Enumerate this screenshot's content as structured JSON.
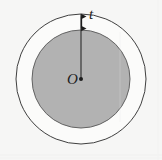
{
  "figure": {
    "background_color": "#f6f6f5",
    "labels": {
      "thickness_label": "t",
      "center_label": "O"
    },
    "geometry": {
      "center_x": 81,
      "center_y": 79,
      "outer_circle_radius": 65,
      "inner_circle_radius": 49,
      "annulus_thickness": 16,
      "outer_circle_fill": "#fbfbfa",
      "outer_circle_stroke": "#3a3a3a",
      "outer_circle_stroke_width": 1,
      "inner_circle_fill": "#b2b2b2",
      "inner_circle_stroke": "#5a5a5a",
      "inner_circle_stroke_width": 1,
      "radius_line_color": "#2b2b2b",
      "center_dot_radius": 2,
      "center_dot_color": "#1d1d1d",
      "arrow_color": "#1d1d1d",
      "arrow_x": 81,
      "arrow_top_y": 15,
      "arrow_bottom_y": 30
    }
  }
}
